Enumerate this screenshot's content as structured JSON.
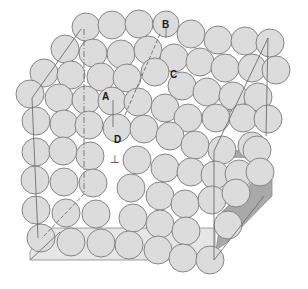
{
  "figure": {
    "colors": {
      "background": "#ffffff",
      "atom_fill": "#dcdcdc",
      "atom_stroke": "#7a7a7a",
      "face_fill": "#e6e6e6",
      "shadow_fill": "#a9a9a9",
      "line": "#7a7a7a"
    },
    "labels": {
      "A": "A",
      "B": "B",
      "C": "C",
      "D": "D",
      "perp": "⊥"
    }
  }
}
